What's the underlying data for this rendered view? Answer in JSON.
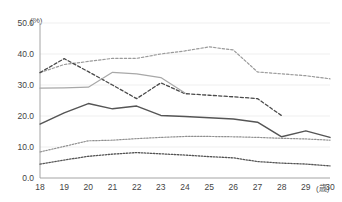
{
  "header": {
    "faint_note": "",
    "y_unit": "(%)",
    "x_unit": "(歳)"
  },
  "chart_data": {
    "type": "line",
    "title": "",
    "xlabel": "(歳)",
    "ylabel": "(%)",
    "x": [
      18,
      19,
      20,
      21,
      22,
      23,
      24,
      25,
      26,
      27,
      28,
      29,
      30
    ],
    "xlim": [
      18,
      30
    ],
    "ylim": [
      0.0,
      50.0
    ],
    "ytick_labels": [
      "0.0",
      "10.0",
      "20.0",
      "30.0",
      "40.0",
      "50.0"
    ],
    "ytick_values": [
      0.0,
      10.0,
      20.0,
      30.0,
      40.0,
      50.0
    ],
    "xtick_labels": [
      "18",
      "19",
      "20",
      "21",
      "22",
      "23",
      "24",
      "25",
      "26",
      "27",
      "28",
      "29",
      "30"
    ],
    "grid": true,
    "grid_color": "#e8e8e8",
    "legend": "none",
    "series": [
      {
        "name": "series-1-dotted-upper",
        "style": "dotted",
        "color": "#9a9a9a",
        "width": 1.2,
        "values": [
          34.0,
          36.6,
          37.6,
          38.6,
          38.6,
          40.0,
          41.0,
          42.3,
          41.3,
          34.2,
          33.6,
          33.0,
          32.0
        ]
      },
      {
        "name": "series-2-dashdot",
        "style": "dashed",
        "color": "#4a4a4a",
        "width": 1.3,
        "values": [
          34.0,
          38.5,
          34.3,
          30.0,
          25.6,
          30.7,
          27.2,
          26.7,
          26.2,
          25.6,
          20.1,
          null,
          null
        ]
      },
      {
        "name": "series-3-solid-light",
        "style": "solid",
        "color": "#a8a8a8",
        "width": 1.2,
        "values": [
          29.0,
          29.1,
          29.3,
          34.1,
          33.6,
          32.4,
          27.4,
          null,
          null,
          null,
          null,
          null,
          null
        ]
      },
      {
        "name": "series-4-solid-dark",
        "style": "solid",
        "color": "#555555",
        "width": 1.5,
        "values": [
          17.4,
          21.0,
          24.0,
          22.3,
          23.2,
          20.2,
          19.8,
          19.4,
          19.0,
          18.0,
          13.3,
          15.2,
          13.1
        ]
      },
      {
        "name": "series-5-dotted-mid",
        "style": "fine-dotted",
        "color": "#8f8f8f",
        "width": 1.2,
        "values": [
          8.4,
          10.2,
          12.0,
          12.2,
          12.7,
          13.1,
          13.4,
          13.4,
          13.3,
          13.1,
          12.8,
          12.6,
          12.2
        ]
      },
      {
        "name": "series-6-dotted-lower",
        "style": "fine-dotted",
        "color": "#555555",
        "width": 1.3,
        "values": [
          4.5,
          5.8,
          7.0,
          7.7,
          8.2,
          7.8,
          7.4,
          6.9,
          6.5,
          5.3,
          4.8,
          4.5,
          3.9
        ]
      }
    ]
  }
}
